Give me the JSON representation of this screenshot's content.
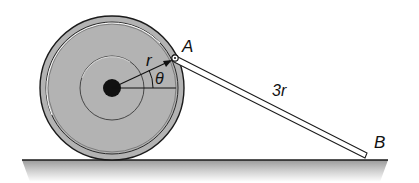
{
  "diagram": {
    "type": "mechanism",
    "labels": {
      "point_a": "A",
      "point_b": "B",
      "radius": "r",
      "angle": "θ",
      "rod_length": "3r"
    },
    "colors": {
      "wheel_fill": "#b5b5b5",
      "hub": "#111111",
      "ground_shade": "#c8c8c8",
      "line": "#1a1a1a"
    }
  }
}
